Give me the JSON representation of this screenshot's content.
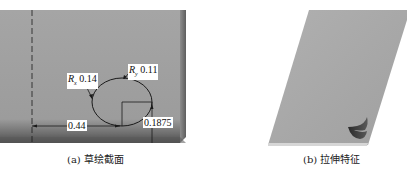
{
  "figure": {
    "panel_a": {
      "caption": "(a) 草绘截面",
      "labels": {
        "rx_symbol": "R",
        "rx_sub": "x",
        "rx_value": "0.14",
        "ry_symbol": "R",
        "ry_sub": "y",
        "ry_value": "0.11",
        "horizontal_dim": "0.44",
        "vertical_dim": "0.1875"
      },
      "colors": {
        "plate": "#a8a8a8",
        "plate_shadow": "#6a6a6a",
        "line": "#1a1a1a"
      }
    },
    "panel_b": {
      "caption": "(b) 拉伸特征",
      "colors": {
        "plate": "#a9a9a9",
        "cut": "#3a3a3a"
      }
    }
  }
}
